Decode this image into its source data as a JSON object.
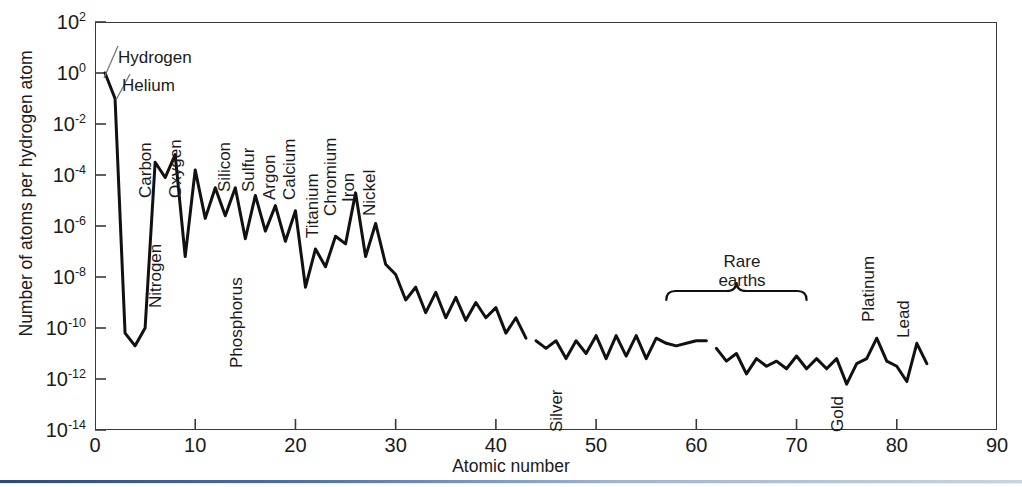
{
  "chart_data": {
    "type": "line",
    "title": "",
    "xlabel": "Atomic number",
    "ylabel": "Number of atoms per hydrogen atom",
    "xlim": [
      0,
      90
    ],
    "ylim_log10": [
      -14,
      2
    ],
    "yscale": "log",
    "grid": false,
    "legend": null,
    "xticks": [
      "0",
      "10",
      "20",
      "30",
      "40",
      "50",
      "60",
      "70",
      "80",
      "90"
    ],
    "xtick_values": [
      0,
      10,
      20,
      30,
      40,
      50,
      60,
      70,
      80,
      90
    ],
    "yticks": [
      "10^2",
      "10^0",
      "10^-2",
      "10^-4",
      "10^-6",
      "10^-8",
      "10^-10",
      "10^-12",
      "10^-14"
    ],
    "ytick_exponents": [
      2,
      0,
      -2,
      -4,
      -6,
      -8,
      -10,
      -12,
      -14
    ],
    "ytick_labels_rich": [
      {
        "mantissa": "10",
        "exponent": "2"
      },
      {
        "mantissa": "10",
        "exponent": "0"
      },
      {
        "mantissa": "10",
        "exponent": "-2"
      },
      {
        "mantissa": "10",
        "exponent": "-4"
      },
      {
        "mantissa": "10",
        "exponent": "-6"
      },
      {
        "mantissa": "10",
        "exponent": "-8"
      },
      {
        "mantissa": "10",
        "exponent": "-10"
      },
      {
        "mantissa": "10",
        "exponent": "-12"
      },
      {
        "mantissa": "10",
        "exponent": "-14"
      }
    ],
    "series": [
      {
        "name": "Light elements (Z 1-43)",
        "x": [
          1,
          2,
          3,
          4,
          5,
          6,
          7,
          8,
          9,
          10,
          11,
          12,
          13,
          14,
          15,
          16,
          17,
          18,
          19,
          20,
          21,
          22,
          23,
          24,
          25,
          26,
          27,
          28,
          29,
          30,
          31,
          32,
          33,
          34,
          35,
          36,
          37,
          38,
          39,
          40,
          41,
          42,
          43
        ],
        "log10_y": [
          0.0,
          -1.0,
          -10.2,
          -10.7,
          -10.0,
          -3.5,
          -4.1,
          -3.2,
          -7.2,
          -3.8,
          -5.7,
          -4.5,
          -5.6,
          -4.5,
          -6.5,
          -4.8,
          -6.2,
          -5.2,
          -6.6,
          -5.4,
          -8.4,
          -6.9,
          -7.6,
          -6.4,
          -6.7,
          -4.7,
          -7.2,
          -5.9,
          -7.5,
          -7.9,
          -8.9,
          -8.4,
          -9.4,
          -8.6,
          -9.6,
          -8.8,
          -9.7,
          -9.0,
          -9.6,
          -9.2,
          -10.2,
          -9.6,
          -10.4
        ]
      },
      {
        "name": "Mid elements (Z 44-61)",
        "x": [
          44,
          45,
          46,
          47,
          48,
          49,
          50,
          51,
          52,
          53,
          54,
          55,
          56,
          57,
          58,
          59,
          60,
          61
        ],
        "log10_y": [
          -10.5,
          -10.8,
          -10.5,
          -11.2,
          -10.5,
          -11.0,
          -10.3,
          -11.2,
          -10.3,
          -11.1,
          -10.3,
          -11.2,
          -10.4,
          -10.6,
          -10.7,
          -10.6,
          -10.5,
          -10.5
        ]
      },
      {
        "name": "Heavy elements (Z 62-83)",
        "x": [
          62,
          63,
          64,
          65,
          66,
          67,
          68,
          69,
          70,
          71,
          72,
          73,
          74,
          75,
          76,
          77,
          78,
          79,
          80,
          81,
          82,
          83
        ],
        "log10_y": [
          -10.8,
          -11.3,
          -11.0,
          -11.8,
          -11.2,
          -11.5,
          -11.3,
          -11.6,
          -11.1,
          -11.6,
          -11.2,
          -11.6,
          -11.2,
          -12.2,
          -11.4,
          -11.2,
          -10.4,
          -11.3,
          -11.5,
          -12.1,
          -10.6,
          -11.4
        ]
      }
    ],
    "annotations": [
      {
        "label": "Hydrogen",
        "orientation": "horizontal",
        "atomic_number": 1,
        "leader": true
      },
      {
        "label": "Helium",
        "orientation": "horizontal",
        "atomic_number": 2,
        "leader": true
      },
      {
        "label": "Carbon",
        "orientation": "vertical",
        "atomic_number": 6
      },
      {
        "label": "Nitrogen",
        "orientation": "vertical",
        "atomic_number": 7
      },
      {
        "label": "Oxygen",
        "orientation": "vertical",
        "atomic_number": 8
      },
      {
        "label": "Silicon",
        "orientation": "vertical",
        "atomic_number": 14
      },
      {
        "label": "Phosphorus",
        "orientation": "vertical",
        "atomic_number": 15
      },
      {
        "label": "Sulfur",
        "orientation": "vertical",
        "atomic_number": 16
      },
      {
        "label": "Argon",
        "orientation": "vertical",
        "atomic_number": 18
      },
      {
        "label": "Calcium",
        "orientation": "vertical",
        "atomic_number": 20
      },
      {
        "label": "Titanium",
        "orientation": "vertical",
        "atomic_number": 22
      },
      {
        "label": "Chromium",
        "orientation": "vertical",
        "atomic_number": 24
      },
      {
        "label": "Iron",
        "orientation": "vertical",
        "atomic_number": 26
      },
      {
        "label": "Nickel",
        "orientation": "vertical",
        "atomic_number": 28
      },
      {
        "label": "Silver",
        "orientation": "vertical",
        "atomic_number": 47
      },
      {
        "label": "Gold",
        "orientation": "vertical",
        "atomic_number": 79
      },
      {
        "label": "Platinum",
        "orientation": "vertical",
        "atomic_number": 78
      },
      {
        "label": "Lead",
        "orientation": "vertical",
        "atomic_number": 82
      }
    ],
    "group_bracket": {
      "label_line1": "Rare",
      "label_line2": "earths",
      "z_start": 57,
      "z_end": 71
    }
  },
  "axes": {
    "y_title": "Number of atoms per hydrogen atom",
    "x_title": "Atomic number"
  },
  "ticks": {
    "x": [
      {
        "label": "0",
        "v": 0
      },
      {
        "label": "10",
        "v": 10
      },
      {
        "label": "20",
        "v": 20
      },
      {
        "label": "30",
        "v": 30
      },
      {
        "label": "40",
        "v": 40
      },
      {
        "label": "50",
        "v": 50
      },
      {
        "label": "60",
        "v": 60
      },
      {
        "label": "70",
        "v": 70
      },
      {
        "label": "80",
        "v": 80
      },
      {
        "label": "90",
        "v": 90
      }
    ]
  },
  "labels": {
    "hydrogen": "Hydrogen",
    "helium": "Helium",
    "carbon": "Carbon",
    "nitrogen": "Nitrogen",
    "oxygen": "Oxygen",
    "silicon": "Silicon",
    "phosphorus": "Phosphorus",
    "sulfur": "Sulfur",
    "argon": "Argon",
    "calcium": "Calcium",
    "titanium": "Titanium",
    "chromium": "Chromium",
    "iron": "Iron",
    "nickel": "Nickel",
    "silver": "Silver",
    "gold": "Gold",
    "platinum": "Platinum",
    "lead": "Lead",
    "rare_earths_1": "Rare",
    "rare_earths_2": "earths"
  },
  "colors": {
    "curve": "#111111",
    "frame": "#3a3a3a",
    "text": "#1a1a1a",
    "background": "#ffffff",
    "accent_rule": "#2b4a7e"
  }
}
